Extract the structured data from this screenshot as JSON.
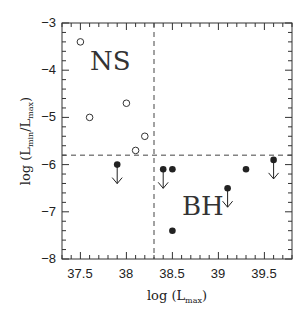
{
  "chart_data": {
    "type": "scatter",
    "title": "",
    "xlabel": "log (L_max)",
    "ylabel": "log (L_min/L_max)",
    "xlim": [
      37.3,
      39.8
    ],
    "ylim": [
      -8,
      -3
    ],
    "x_ticks": [
      "37.5",
      "38",
      "38.5",
      "39",
      "39.5"
    ],
    "y_ticks": [
      "-3",
      "-4",
      "-5",
      "-6",
      "-7",
      "-8"
    ],
    "grid": false,
    "dividers": {
      "vertical_x": 38.3,
      "horizontal_y": -5.8,
      "style": "dashed"
    },
    "annotations": [
      {
        "text": "NS",
        "x": 37.75,
        "y": -4.2
      },
      {
        "text": "BH",
        "x": 38.9,
        "y": -6.9
      }
    ],
    "series": [
      {
        "name": "NS",
        "marker": "open-circle",
        "points": [
          {
            "x": 37.5,
            "y": -3.4
          },
          {
            "x": 37.6,
            "y": -5.0
          },
          {
            "x": 38.0,
            "y": -4.7
          },
          {
            "x": 38.1,
            "y": -5.7
          },
          {
            "x": 38.2,
            "y": -5.4
          }
        ]
      },
      {
        "name": "BH",
        "marker": "filled-circle",
        "points": [
          {
            "x": 37.9,
            "y": -6.0,
            "upper_limit": true
          },
          {
            "x": 38.4,
            "y": -6.1,
            "upper_limit": true
          },
          {
            "x": 38.5,
            "y": -6.1,
            "upper_limit": false
          },
          {
            "x": 38.5,
            "y": -7.4,
            "upper_limit": false
          },
          {
            "x": 39.1,
            "y": -6.5,
            "upper_limit": true
          },
          {
            "x": 39.3,
            "y": -6.1,
            "upper_limit": false
          },
          {
            "x": 39.6,
            "y": -5.9,
            "upper_limit": true
          }
        ]
      }
    ]
  },
  "labels": {
    "ns": "NS",
    "bh": "BH",
    "x_axis_main": "log (L",
    "x_axis_sub": "max",
    "x_axis_close": ")",
    "y_axis_main": "log (L",
    "y_axis_sub1": "min",
    "y_axis_mid": "/L",
    "y_axis_sub2": "max",
    "y_axis_close": ")",
    "x_ticks": [
      "37.5",
      "38",
      "38.5",
      "39",
      "39.5"
    ],
    "y_ticks": [
      "−3",
      "−4",
      "−5",
      "−6",
      "−7",
      "−8"
    ]
  }
}
